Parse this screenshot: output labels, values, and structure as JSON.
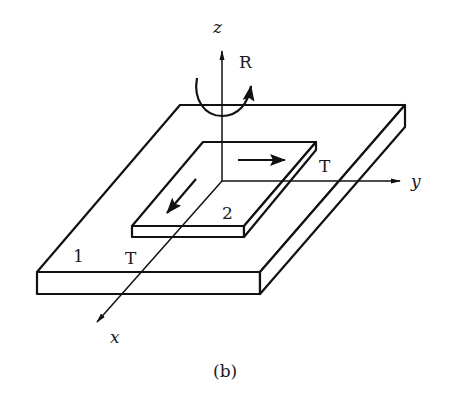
{
  "figure": {
    "caption": "(b)",
    "axes": {
      "x_label": "x",
      "y_label": "y",
      "z_label": "z"
    },
    "rotation_label": "R",
    "plates": [
      {
        "id": "1",
        "label": "1",
        "description": "large base plate"
      },
      {
        "id": "2",
        "label": "2",
        "description": "small upper plate"
      }
    ],
    "translation_labels": [
      {
        "label": "T",
        "direction": "y"
      },
      {
        "label": "T",
        "direction": "x"
      }
    ],
    "colors": {
      "stroke": "#111111",
      "background": "#ffffff",
      "text": "#1a1a1a"
    }
  }
}
